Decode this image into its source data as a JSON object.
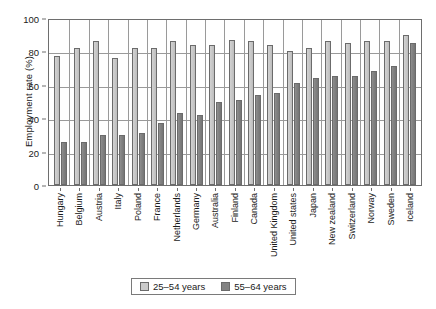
{
  "chart_data": {
    "type": "bar",
    "title": "",
    "xlabel": "",
    "ylabel": "Employment rate (%)",
    "ylim": [
      0,
      100
    ],
    "yticks": [
      0,
      20,
      40,
      60,
      80,
      100
    ],
    "grid": true,
    "legend_position": "bottom",
    "categories": [
      "Hungary",
      "Belgium",
      "Austria",
      "Italy",
      "Poland",
      "France",
      "Netherlands",
      "Germany",
      "Australia",
      "Finland",
      "Canada",
      "United Kingdom",
      "United states",
      "Japan",
      "New zealand",
      "Switzerland",
      "Norway",
      "Sweden",
      "Iceland"
    ],
    "series": [
      {
        "name": "25–54 years",
        "color": "#cbcbcb",
        "values": [
          77,
          82,
          86,
          76,
          82,
          82,
          86,
          84,
          84,
          87,
          86,
          84,
          80,
          82,
          86,
          85,
          86,
          86,
          90
        ]
      },
      {
        "name": "55–64 years",
        "color": "#838383",
        "values": [
          26,
          26,
          30,
          30,
          31,
          37,
          43,
          42,
          50,
          51,
          54,
          55,
          61,
          64,
          65,
          65,
          68,
          71,
          85
        ]
      }
    ]
  },
  "legend": {
    "items": [
      {
        "label": "25–54 years",
        "swatch": "light"
      },
      {
        "label": "55–64 years",
        "swatch": "dark"
      }
    ]
  }
}
